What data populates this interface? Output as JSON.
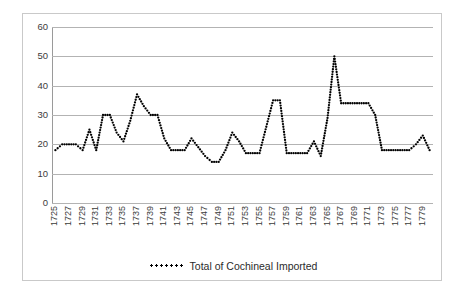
{
  "chart_data": {
    "type": "line",
    "title": "",
    "subtitle": "",
    "xlabel": "",
    "ylabel": "",
    "ylim": [
      0,
      60
    ],
    "yticks": [
      0,
      10,
      20,
      30,
      40,
      50,
      60
    ],
    "grid": true,
    "legend_position": "bottom",
    "line_style": "dotted",
    "legend": [
      "Total of Cochineal Imported"
    ],
    "x_tick_labels": [
      "1725",
      "1727",
      "1729",
      "1731",
      "1733",
      "1735",
      "1737",
      "1739",
      "1741",
      "1743",
      "1745",
      "1747",
      "1749",
      "1751",
      "1753",
      "1755",
      "1757",
      "1759",
      "1761",
      "1763",
      "1765",
      "1767",
      "1769",
      "1771",
      "1773",
      "1775",
      "1777",
      "1779"
    ],
    "x": [
      1725,
      1726,
      1727,
      1728,
      1729,
      1730,
      1731,
      1732,
      1733,
      1734,
      1735,
      1736,
      1737,
      1738,
      1739,
      1740,
      1741,
      1742,
      1743,
      1744,
      1745,
      1746,
      1747,
      1748,
      1749,
      1750,
      1751,
      1752,
      1753,
      1754,
      1755,
      1756,
      1757,
      1758,
      1759,
      1760,
      1761,
      1762,
      1763,
      1764,
      1765,
      1766,
      1767,
      1768,
      1769,
      1770,
      1771,
      1772,
      1773,
      1774,
      1775,
      1776,
      1777,
      1778,
      1779,
      1780
    ],
    "series": [
      {
        "name": "Total of Cochineal Imported",
        "color": "#000000",
        "values": [
          18,
          20,
          20,
          20,
          18,
          25,
          18,
          30,
          30,
          24,
          21,
          28,
          37,
          33,
          30,
          30,
          22,
          18,
          18,
          18,
          22,
          19,
          16,
          14,
          14,
          18,
          24,
          21,
          17,
          17,
          17,
          26,
          35,
          35,
          17,
          17,
          17,
          17,
          21,
          16,
          29,
          50,
          34,
          34,
          34,
          34,
          34,
          30,
          18,
          18,
          18,
          18,
          18,
          20,
          23,
          18
        ]
      }
    ]
  }
}
